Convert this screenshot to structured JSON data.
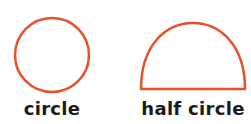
{
  "shapes": [
    {
      "name": "circle",
      "label": "circle",
      "stroke": "#e8502a"
    },
    {
      "name": "half-circle",
      "label": "half circle",
      "stroke": "#e8502a"
    }
  ]
}
